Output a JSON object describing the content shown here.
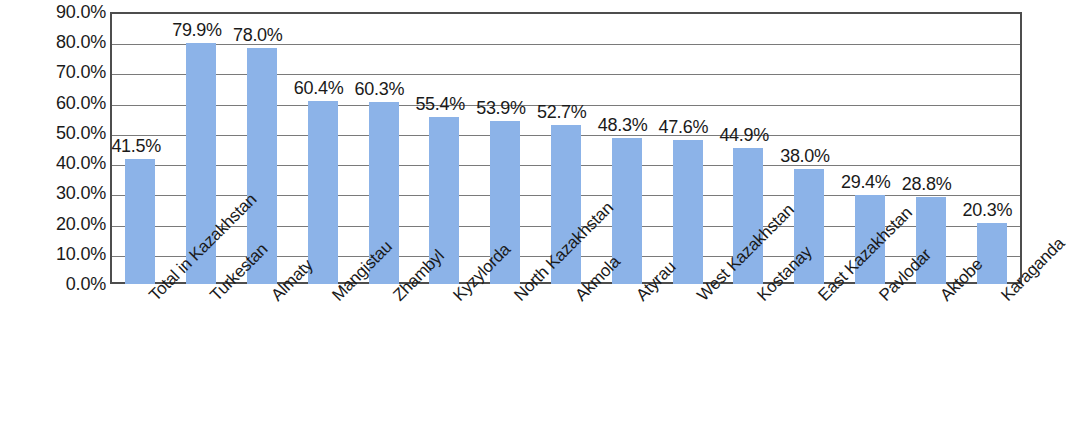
{
  "chart_data": {
    "type": "bar",
    "title": "",
    "subtitle": "",
    "xlabel": "",
    "ylabel": "",
    "ylim": [
      0,
      90
    ],
    "ytick_step": 10,
    "grid": true,
    "legend": false,
    "legend_position": "none",
    "value_label_suffix": "%",
    "bar_color": "#8cb3e8",
    "gridline_color": "#7a7a7a",
    "axis_color": "#4d4d4d",
    "text_color": "#1a1a1a",
    "ytick_labels": [
      "90.0%",
      "80.0%",
      "70.0%",
      "60.0%",
      "50.0%",
      "40.0%",
      "30.0%",
      "20.0%",
      "10.0%",
      "0.0%"
    ],
    "ytick_values": [
      90,
      80,
      70,
      60,
      50,
      40,
      30,
      20,
      10,
      0
    ],
    "categories": [
      "Total in Kazakhstan",
      "Turkestan",
      "Almaty",
      "Mangistau",
      "Zhambyl",
      "Kyzylorda",
      "North Kazakhstan",
      "Akmola",
      "Atyrau",
      "West Kazakhstan",
      "Kostanay",
      "East Kazakhstan",
      "Pavlodar",
      "Aktobe",
      "Karaganda"
    ],
    "values": [
      41.5,
      79.9,
      78.0,
      60.4,
      60.3,
      55.4,
      53.9,
      52.7,
      48.3,
      47.6,
      44.9,
      38.0,
      29.4,
      28.8,
      20.3
    ],
    "data_labels": [
      "41.5%",
      "79.9%",
      "78.0%",
      "60.4%",
      "60.3%",
      "55.4%",
      "53.9%",
      "52.7%",
      "48.3%",
      "47.6%",
      "44.9%",
      "38.0%",
      "29.4%",
      "28.8%",
      "20.3%"
    ]
  }
}
